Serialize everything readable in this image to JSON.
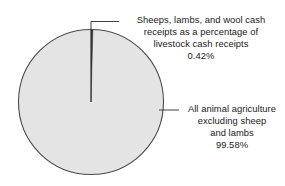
{
  "chart_data": {
    "type": "pie",
    "title": "",
    "subtitle": "",
    "xlabel": "",
    "ylabel": "",
    "legend_position": "callout-labels",
    "grid": false,
    "categories": [
      "Sheeps, lambs, and wool cash receipts as a percentage of livestock cash receipts",
      "All animal agriculture excluding sheep and lambs"
    ],
    "values": [
      0.42,
      99.58
    ],
    "value_labels": [
      "0.42%",
      "99.58%"
    ],
    "units": "percent",
    "start_angle_deg": 0,
    "direction": "clockwise",
    "slices": [
      {
        "name": "sheep-lambs-wool-slice",
        "value": 0.42,
        "value_label": "0.42%",
        "color": "#3a3a3a",
        "label_lines": [
          "Sheeps, lambs, and wool cash",
          "receipts as a percentage of",
          "livestock cash receipts",
          "0.42%"
        ]
      },
      {
        "name": "all-animal-agriculture-slice",
        "value": 99.58,
        "value_label": "99.58%",
        "color": "#e4e4e4",
        "label_lines": [
          "All animal agriculture",
          "excluding sheep",
          "and lambs",
          "99.58%"
        ]
      }
    ]
  },
  "callouts": {
    "sheep": {
      "line1": "Sheeps, lambs, and wool cash",
      "line2": "receipts as a percentage of",
      "line3": "livestock cash receipts",
      "line4": "0.42%"
    },
    "other": {
      "line1": "All animal agriculture",
      "line2": "excluding sheep",
      "line3": "and lambs",
      "line4": "99.58%"
    }
  },
  "colors": {
    "background": "#ffffff",
    "major_slice_fill": "#e4e4e4",
    "minor_slice_fill": "#3a3a3a",
    "outline": "#4a4a4a",
    "leader_line": "#2b2b2b",
    "text": "#1a1a1a"
  }
}
